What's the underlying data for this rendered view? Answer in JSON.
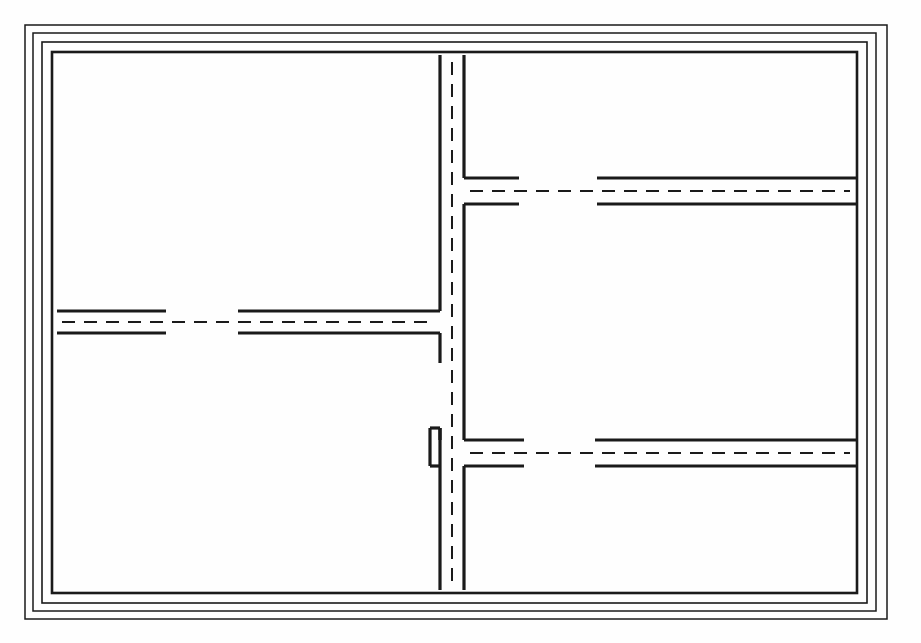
{
  "document": {
    "kind": "technical-line-drawing",
    "subject": "road-network-plan",
    "canvas": {
      "width": 921,
      "height": 643,
      "background": "#fefefe"
    }
  },
  "style": {
    "ink": "#1a1a1a",
    "ink_soft": "#2b2b2b",
    "frame_stroke_width": 1.6,
    "road_edge_stroke_width": 3.2,
    "centerline_stroke_width": 2.0,
    "centerline_dash": "13 9"
  },
  "frame": {
    "label": "nested-rectangular-border",
    "rings": [
      {
        "name": "ring-outer",
        "x": 25,
        "y": 25,
        "width": 862,
        "height": 594,
        "stroke_width": 1.5
      },
      {
        "name": "ring-second",
        "x": 33,
        "y": 33,
        "width": 843,
        "height": 578,
        "stroke_width": 1.5
      },
      {
        "name": "ring-third",
        "x": 42,
        "y": 42,
        "width": 825,
        "height": 561,
        "stroke_width": 1.6
      },
      {
        "name": "ring-inner-border",
        "x": 52,
        "y": 52,
        "width": 805,
        "height": 541,
        "stroke_width": 2.6
      }
    ]
  },
  "roads": {
    "vertical_main": {
      "name": "vertical-road",
      "center_x": 452,
      "half_width": 12,
      "edge_left_x": 440,
      "edge_right_x": 464,
      "top_y": 55,
      "bottom_y": 590,
      "centerline_top_y": 62,
      "centerline_bottom_y": 586,
      "edge_segments": [
        {
          "side": "left",
          "x": 440,
          "y1": 55,
          "y2": 311
        },
        {
          "side": "left",
          "x": 440,
          "y1": 333,
          "y2": 363
        },
        {
          "side": "left",
          "x": 440,
          "y1": 428,
          "y2": 590
        },
        {
          "side": "right",
          "x": 464,
          "y1": 55,
          "y2": 178
        },
        {
          "side": "right",
          "x": 464,
          "y1": 204,
          "y2": 440
        },
        {
          "side": "right",
          "x": 464,
          "y1": 466,
          "y2": 590
        }
      ]
    },
    "branches": [
      {
        "name": "upper-right-branch",
        "direction": "east",
        "from_x": 464,
        "to_x": 856,
        "center_y": 191,
        "edge_top_y": 178,
        "edge_bottom_y": 204,
        "centerline_dash_from_x": 470,
        "centerline_dash_to_x": 850,
        "segments": [
          {
            "part": "stub",
            "x1": 464,
            "x2": 519
          },
          {
            "part": "run",
            "x1": 597,
            "x2": 856
          }
        ],
        "centerline_gap": {
          "x1": 519,
          "x2": 597
        }
      },
      {
        "name": "left-branch",
        "direction": "west",
        "from_x": 57,
        "to_x": 440,
        "center_y": 322,
        "edge_top_y": 311,
        "edge_bottom_y": 333,
        "centerline_dash_from_x": 62,
        "centerline_dash_to_x": 434,
        "segments": [
          {
            "part": "stub",
            "x1": 57,
            "x2": 166
          },
          {
            "part": "run",
            "x1": 238,
            "x2": 440
          }
        ],
        "centerline_gap": {
          "x1": 166,
          "x2": 238
        }
      },
      {
        "name": "lower-right-branch",
        "direction": "east",
        "from_x": 464,
        "to_x": 856,
        "center_y": 453,
        "edge_top_y": 440,
        "edge_bottom_y": 466,
        "centerline_dash_from_x": 470,
        "centerline_dash_to_x": 850,
        "segments": [
          {
            "part": "stub",
            "x1": 464,
            "x2": 524
          },
          {
            "part": "run",
            "x1": 595,
            "x2": 856
          }
        ],
        "centerline_gap": {
          "x1": 524,
          "x2": 595
        }
      },
      {
        "name": "lower-left-stub",
        "direction": "west",
        "from_x": 430,
        "to_x": 440,
        "center_y": 453,
        "edge_top_y": 428,
        "edge_bottom_y": 466,
        "segments": [],
        "centerline_gap": null
      }
    ],
    "junctions": [
      {
        "name": "junction-upper-east",
        "type": "T",
        "x": 452,
        "y": 191
      },
      {
        "name": "junction-mid-west",
        "type": "T",
        "x": 452,
        "y": 322
      },
      {
        "name": "junction-lower-east",
        "type": "T",
        "x": 452,
        "y": 453
      }
    ]
  }
}
